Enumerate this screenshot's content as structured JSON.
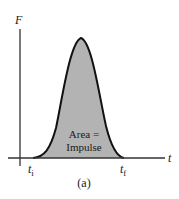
{
  "figure": {
    "y_axis_label": "F",
    "x_axis_label": "t",
    "t_start_label": "t",
    "t_start_sub": "i",
    "t_end_label": "t",
    "t_end_sub": "f",
    "area_label_line1": "Area =",
    "area_label_line2": "Impulse",
    "caption": "(a)",
    "colors": {
      "curve": "#111111",
      "fill": "#b3b3b3",
      "axis": "#333333",
      "background": "#ffffff"
    }
  }
}
